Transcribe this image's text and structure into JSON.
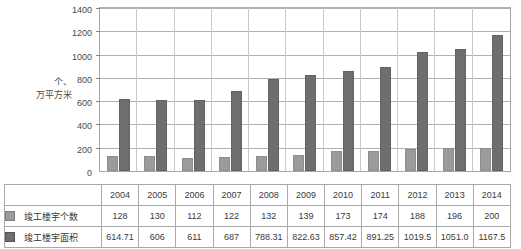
{
  "chart_data": {
    "type": "bar",
    "title": "",
    "xlabel": "",
    "ylabel": "个、万平方米",
    "ylabel_lines": [
      "个、",
      "万平方米"
    ],
    "ylim": [
      0,
      1400
    ],
    "ytick_step": 200,
    "grid": true,
    "legend_position": "table-left",
    "categories": [
      "2004",
      "2005",
      "2006",
      "2007",
      "2008",
      "2009",
      "2010",
      "2011",
      "2012",
      "2013",
      "2014"
    ],
    "yticks": [
      "1400",
      "1200",
      "1000",
      "800",
      "600",
      "400",
      "200",
      "0"
    ],
    "series": [
      {
        "name": "竣工楼宇个数",
        "color": "#9b9b9b",
        "values": [
          128,
          130,
          112,
          122,
          132,
          139,
          173,
          174,
          188,
          196,
          200
        ],
        "labels": [
          "128",
          "130",
          "112",
          "122",
          "132",
          "139",
          "173",
          "174",
          "188",
          "196",
          "200"
        ]
      },
      {
        "name": "竣工楼宇面积",
        "color": "#6e6e6e",
        "values": [
          614.71,
          606,
          611,
          687,
          788.31,
          822.63,
          857.42,
          891.25,
          1019.5,
          1051.0,
          1167.5
        ],
        "labels": [
          "614.71",
          "606",
          "611",
          "687",
          "788.31",
          "822.63",
          "857.42",
          "891.25",
          "1019.5",
          "1051.0",
          "1167.5"
        ]
      }
    ]
  },
  "table": {
    "header_label": "",
    "years": [
      "2004",
      "2005",
      "2006",
      "2007",
      "2008",
      "2009",
      "2010",
      "2011",
      "2012",
      "2013",
      "2014"
    ],
    "rows": [
      {
        "label": "竣工楼宇个数",
        "swatch": "count",
        "values": [
          "128",
          "130",
          "112",
          "122",
          "132",
          "139",
          "173",
          "174",
          "188",
          "196",
          "200"
        ]
      },
      {
        "label": "竣工楼宇面积",
        "swatch": "area",
        "values": [
          "614.71",
          "606",
          "611",
          "687",
          "788.31",
          "822.63",
          "857.42",
          "891.25",
          "1019.5",
          "1051.0",
          "1167.5"
        ]
      }
    ]
  },
  "colors": {
    "series_count": "#9b9b9b",
    "series_area": "#6e6e6e",
    "grid": "#b0b0b0",
    "border": "#a9a9a9",
    "text": "#3a3a3a"
  }
}
